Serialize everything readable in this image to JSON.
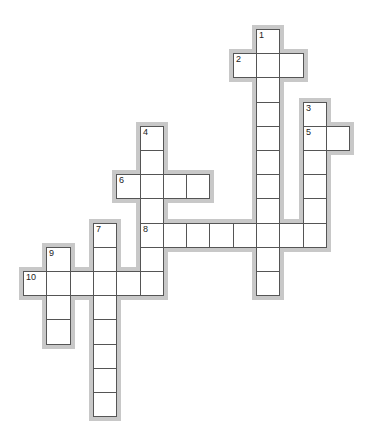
{
  "puzzle": {
    "type": "crossword",
    "grid": {
      "origin_x": 23,
      "origin_y": 29,
      "cell_w": 23.3,
      "cell_h": 24.2
    },
    "colors": {
      "cell_border": "#555555",
      "halo": "#c8c8c8",
      "cell_fill": "#ffffff",
      "number": "#222222"
    },
    "entries": [
      {
        "number": "1",
        "direction": "down",
        "row": 0,
        "col": 10,
        "length": 11
      },
      {
        "number": "2",
        "direction": "across",
        "row": 1,
        "col": 9,
        "length": 3
      },
      {
        "number": "3",
        "direction": "down",
        "row": 3,
        "col": 12,
        "length": 6
      },
      {
        "number": "4",
        "direction": "down",
        "row": 4,
        "col": 5,
        "length": 7
      },
      {
        "number": "5",
        "direction": "across",
        "row": 4,
        "col": 12,
        "length": 2
      },
      {
        "number": "6",
        "direction": "across",
        "row": 6,
        "col": 4,
        "length": 4
      },
      {
        "number": "7",
        "direction": "down",
        "row": 8,
        "col": 3,
        "length": 8
      },
      {
        "number": "8",
        "direction": "across",
        "row": 8,
        "col": 5,
        "length": 8
      },
      {
        "number": "9",
        "direction": "down",
        "row": 9,
        "col": 1,
        "length": 4
      },
      {
        "number": "10",
        "direction": "across",
        "row": 10,
        "col": 0,
        "length": 6
      }
    ]
  }
}
